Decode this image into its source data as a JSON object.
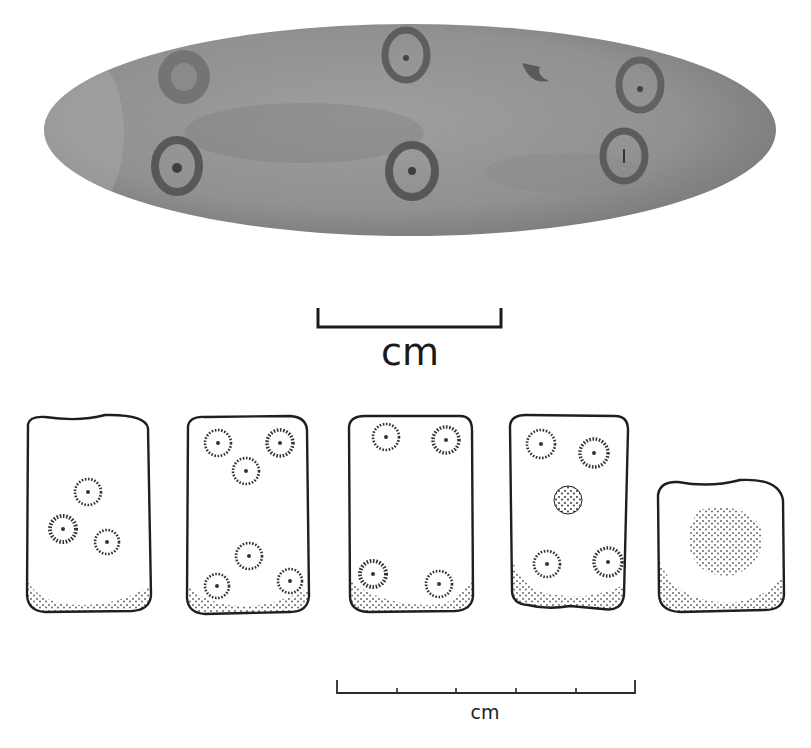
{
  "figure": {
    "photo": {
      "subject": "elongated oval stone object with incised ring-and-dot marks",
      "ring_dot_count": 6,
      "colors": {
        "stone": "#8f8f8f",
        "stone_light": "#a9a9a9",
        "ring": "#5a5a5a"
      }
    },
    "scale_bar_top": {
      "label": "cm",
      "ticks": 0
    },
    "drawings": [
      {
        "id": "die-1",
        "ring_dots": 3
      },
      {
        "id": "die-2",
        "ring_dots": 6
      },
      {
        "id": "die-3",
        "ring_dots": 4
      },
      {
        "id": "die-4",
        "ring_dots": 4
      },
      {
        "id": "die-5",
        "ring_dots": 0
      }
    ],
    "scale_bar_bottom": {
      "label": "cm",
      "divisions": 5
    }
  }
}
